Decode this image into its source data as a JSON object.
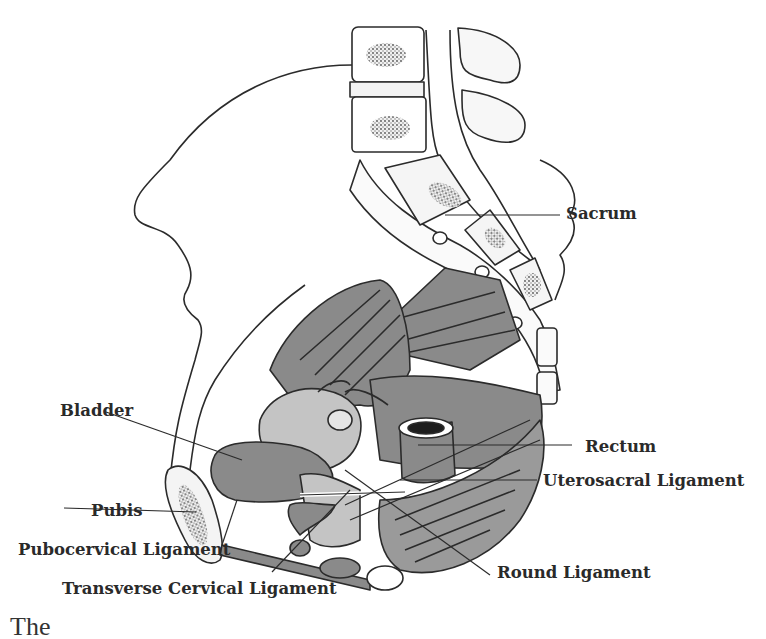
{
  "figure": {
    "labels": {
      "sacrum": "Sacrum",
      "bladder": "Bladder",
      "rectum": "Rectum",
      "uterosacral_ligament": "Uterosacral Ligament",
      "pubis": "Pubis",
      "pubocervical_ligament": "Pubocervical Ligament",
      "round_ligament": "Round Ligament",
      "transverse_cervical_ligament": "Transverse Cervical Ligament"
    },
    "colors": {
      "outline": "#2b2b2b",
      "muscle": "#8a8a8a",
      "organ_light": "#c4c4c4",
      "bone_fill": "#f2f2f2",
      "background": "#ffffff"
    }
  },
  "caption": {
    "text": "The"
  }
}
